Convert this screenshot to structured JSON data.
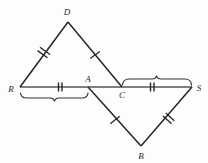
{
  "figure": {
    "type": "geometry-diagram",
    "background_color": "#fdfdfd",
    "stroke_color": "#262626",
    "baseline_color": "#555555",
    "brace_color": "#333333"
  },
  "points": [
    {
      "name": "D",
      "label": "D",
      "x": 68,
      "y": 22,
      "label_x": 67,
      "label_y": 12
    },
    {
      "name": "R",
      "label": "R",
      "x": 20,
      "y": 87,
      "label_x": 11,
      "label_y": 89
    },
    {
      "name": "A",
      "label": "A",
      "x": 88,
      "y": 87,
      "label_x": 88,
      "label_y": 79
    },
    {
      "name": "C",
      "label": "C",
      "x": 122,
      "y": 87,
      "label_x": 122,
      "label_y": 95
    },
    {
      "name": "S",
      "label": "S",
      "x": 192,
      "y": 87,
      "label_x": 199,
      "label_y": 88
    },
    {
      "name": "B",
      "label": "B",
      "x": 141,
      "y": 146,
      "label_x": 141,
      "label_y": 156
    }
  ],
  "segments": [
    {
      "name": "segment-D-R",
      "from": "D",
      "to": "R",
      "ticks": 2
    },
    {
      "name": "segment-D-C",
      "from": "D",
      "to": "C",
      "ticks": 1
    },
    {
      "name": "segment-R-S",
      "from": "R",
      "to": "S",
      "ticks": 0
    },
    {
      "name": "segment-A-B",
      "from": "A",
      "to": "B",
      "ticks": 1
    },
    {
      "name": "segment-B-S",
      "from": "B",
      "to": "S",
      "ticks": 2
    }
  ],
  "congruence_ticks": [
    {
      "name": "tick-DR",
      "segment": "D-R",
      "count": 2,
      "at": 0.5
    },
    {
      "name": "tick-DC",
      "segment": "D-C",
      "count": 1,
      "at": 0.5
    },
    {
      "name": "tick-RA",
      "segment": "R-A",
      "count": 2,
      "at": 0.59
    },
    {
      "name": "tick-CS",
      "segment": "C-S",
      "count": 2,
      "at": 0.43
    },
    {
      "name": "tick-AB",
      "segment": "A-B",
      "count": 1,
      "at": 0.5
    },
    {
      "name": "tick-BS",
      "segment": "B-S",
      "count": 2,
      "at": 0.53
    }
  ],
  "braces": [
    {
      "name": "brace-R-A",
      "spans": "R to A",
      "from_x": 20,
      "to_x": 88,
      "y": 93,
      "direction": "down"
    },
    {
      "name": "brace-C-S",
      "spans": "C to S",
      "from_x": 122,
      "to_x": 192,
      "y": 79,
      "direction": "up"
    }
  ]
}
